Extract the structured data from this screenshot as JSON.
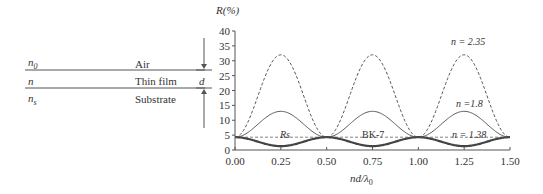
{
  "diagram": {
    "layers": [
      {
        "index_label": "n",
        "index_sub": "0",
        "medium": "Air"
      },
      {
        "index_label": "n",
        "index_sub": "",
        "medium": "Thin film"
      },
      {
        "index_label": "n",
        "index_sub": "s",
        "medium": "Substrate"
      }
    ],
    "thickness_label": "d"
  },
  "chart_data": {
    "type": "line",
    "title": "",
    "xlabel": "nd/λ0",
    "ylabel": "R(%)",
    "xlim": [
      0,
      1.5
    ],
    "ylim": [
      0,
      40
    ],
    "x_ticks": [
      "0.00",
      "0.25",
      "0.50",
      "0.75",
      "1.00",
      "1.25",
      "1.50"
    ],
    "y_ticks": [
      "0",
      "5",
      "10",
      "15",
      "20",
      "25",
      "30",
      "35",
      "40"
    ],
    "grid": false,
    "x": [
      0.0,
      0.25,
      0.5,
      0.75,
      1.0,
      1.25,
      1.5
    ],
    "series": [
      {
        "name": "n = 2.35",
        "style": "dashed",
        "values": [
          4.3,
          32.0,
          4.3,
          32.0,
          4.3,
          32.0,
          4.3
        ]
      },
      {
        "name": "n = 1.8",
        "style": "solid-thin",
        "values": [
          4.3,
          13.0,
          4.3,
          13.0,
          4.3,
          13.0,
          4.3
        ]
      },
      {
        "name": "n = 1.38",
        "style": "solid-thick",
        "values": [
          4.3,
          1.3,
          4.3,
          1.3,
          4.3,
          1.3,
          4.3
        ]
      },
      {
        "name": "Rs (BK-7)",
        "style": "dashed-flat",
        "values": [
          4.3,
          4.3,
          4.3,
          4.3,
          4.3,
          4.3,
          4.3
        ]
      }
    ],
    "annotations": [
      "n = 2.35",
      "n =1.8",
      "n = 1.38",
      "Rs",
      "BK-7"
    ]
  },
  "labels": {
    "ylabel": "R(%)",
    "xlabel_main": "nd/λ",
    "xlabel_sub": "0",
    "ann_235": "n = 2.35",
    "ann_18": "n =1.8",
    "ann_138": "n = 1.38",
    "ann_rs": "Rs",
    "ann_bk7": "BK-7"
  }
}
